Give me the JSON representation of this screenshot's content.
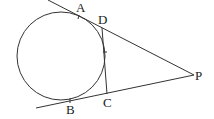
{
  "diagram": {
    "circle": {
      "cx": 61,
      "cy": 56,
      "r": 44
    },
    "points": {
      "A": {
        "label": "A",
        "x": 80,
        "y": 14
      },
      "D": {
        "label": "D",
        "x": 103,
        "y": 28
      },
      "P": {
        "label": "P",
        "x": 194,
        "y": 75
      },
      "B": {
        "label": "B",
        "x": 70,
        "y": 101
      },
      "C": {
        "label": "C",
        "x": 107,
        "y": 94
      }
    },
    "labels": {
      "A": "A",
      "D": "D",
      "P": "P",
      "B": "B",
      "C": "C"
    }
  }
}
